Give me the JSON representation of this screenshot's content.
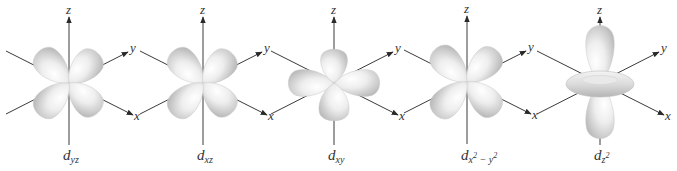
{
  "figure": {
    "axis_labels": {
      "x": "x",
      "y": "y",
      "z": "z"
    },
    "colors": {
      "lobe_light": "#ffffff",
      "lobe_mid": "#e6e6e6",
      "lobe_dark": "#bdbdbd",
      "axis": "#3a3a3a",
      "text": "#333333"
    },
    "orbitals": [
      {
        "id": "dyz",
        "label_main": "d",
        "label_sub": "yz",
        "label_sup": "",
        "label_sub2": "",
        "label_sup2": "",
        "shape": "cloverleaf-yz"
      },
      {
        "id": "dxz",
        "label_main": "d",
        "label_sub": "xz",
        "label_sup": "",
        "label_sub2": "",
        "label_sup2": "",
        "shape": "cloverleaf-xz"
      },
      {
        "id": "dxy",
        "label_main": "d",
        "label_sub": "xy",
        "label_sup": "",
        "label_sub2": "",
        "label_sup2": "",
        "shape": "cloverleaf-xy"
      },
      {
        "id": "dx2y2",
        "label_main": "d",
        "label_sub": "x",
        "label_sup": "2",
        "label_sub2": " − y",
        "label_sup2": "2",
        "shape": "cloverleaf-x2y2"
      },
      {
        "id": "dz2",
        "label_main": "d",
        "label_sub": "z",
        "label_sup": "2",
        "label_sub2": "",
        "label_sup2": "",
        "shape": "dumbbell-torus"
      }
    ]
  }
}
